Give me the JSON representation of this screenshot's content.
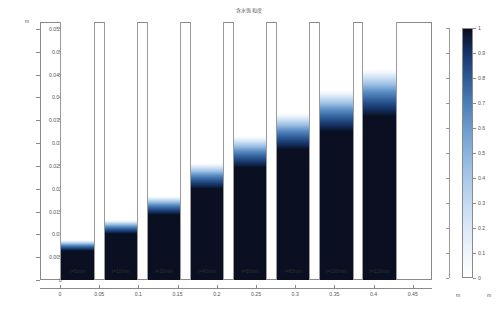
{
  "chart_data": {
    "type": "heatmap",
    "title": "含水饱和度",
    "xlabel": "m",
    "ylabel": "m",
    "xlim": [
      -0.0255,
      0.4745
    ],
    "ylim": [
      0,
      0.0565
    ],
    "grid": false,
    "legend_position": "right",
    "x_ticks": [
      "0",
      "0.05",
      "0.1",
      "0.15",
      "0.2",
      "0.25",
      "0.3",
      "0.35",
      "0.4",
      "0.45"
    ],
    "x_tick_values": [
      0,
      0.05,
      0.1,
      0.15,
      0.2,
      0.25,
      0.3,
      0.35,
      0.4,
      0.45
    ],
    "y_ticks": [
      "0",
      "0.005",
      "0.01",
      "0.015",
      "0.02",
      "0.025",
      "0.03",
      "0.035",
      "0.04",
      "0.045",
      "0.05",
      "0.055"
    ],
    "y_tick_values": [
      0,
      0.005,
      0.01,
      0.015,
      0.02,
      0.025,
      0.03,
      0.035,
      0.04,
      0.045,
      0.05,
      0.055
    ],
    "colorbar": {
      "label": "",
      "unit": "m",
      "min": 0,
      "max": 1,
      "ticks": [
        "0",
        "0.1",
        "0.2",
        "0.3",
        "0.4",
        "0.5",
        "0.6",
        "0.7",
        "0.8",
        "0.9",
        "1"
      ],
      "tick_values": [
        0,
        0.1,
        0.2,
        0.3,
        0.4,
        0.5,
        0.6,
        0.7,
        0.8,
        0.9,
        1.0
      ],
      "low_color": "#ffffff",
      "mid_color": "#8ab4dd",
      "high_color": "#070d1c"
    },
    "categories": [
      "t=5min",
      "t=10min",
      "t=20min",
      "t=40min",
      "t=60min",
      "t=80min",
      "t=100min",
      "t=120min"
    ],
    "series": [
      {
        "name": "wetting front height (m)",
        "values": [
          0.007,
          0.0108,
          0.0152,
          0.0212,
          0.0262,
          0.0303,
          0.0345,
          0.0382
        ]
      }
    ],
    "columns": [
      {
        "label": "t=5min",
        "x_center": 0.0225,
        "front": 0.007,
        "transition": 0.0016,
        "saturation": 1.0
      },
      {
        "label": "t=10min",
        "x_center": 0.0775,
        "front": 0.0108,
        "transition": 0.002,
        "saturation": 1.0
      },
      {
        "label": "t=20min",
        "x_center": 0.1325,
        "front": 0.0152,
        "transition": 0.0028,
        "saturation": 1.0
      },
      {
        "label": "t=40min",
        "x_center": 0.1875,
        "front": 0.0212,
        "transition": 0.0038,
        "saturation": 1.0
      },
      {
        "label": "t=60min",
        "x_center": 0.2425,
        "front": 0.0262,
        "transition": 0.0046,
        "saturation": 1.0
      },
      {
        "label": "t=80min",
        "x_center": 0.2975,
        "front": 0.0303,
        "transition": 0.0054,
        "saturation": 1.0
      },
      {
        "label": "t=100min",
        "x_center": 0.3525,
        "front": 0.0345,
        "transition": 0.0062,
        "saturation": 1.0
      },
      {
        "label": "t=120min",
        "x_center": 0.4075,
        "front": 0.0382,
        "transition": 0.007,
        "saturation": 1.0
      }
    ],
    "column_width": 0.044
  }
}
